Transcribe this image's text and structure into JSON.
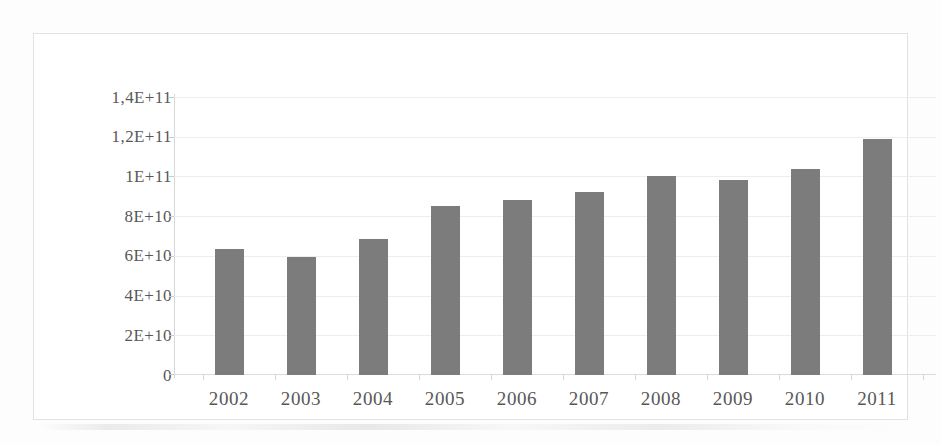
{
  "chart_data": {
    "type": "bar",
    "title": "",
    "subtitle": "",
    "xlabel": "",
    "ylabel": "",
    "categories": [
      "2002",
      "2003",
      "2004",
      "2005",
      "2006",
      "2007",
      "2008",
      "2009",
      "2010",
      "2011"
    ],
    "values": [
      63500000000.0,
      59500000000.0,
      68500000000.0,
      85000000000.0,
      88000000000.0,
      92000000000.0,
      100000000000.0,
      98000000000.0,
      104000000000.0,
      119000000000.0
    ],
    "series": [
      {
        "name": "",
        "values": [
          63500000000.0,
          59500000000.0,
          68500000000.0,
          85000000000.0,
          88000000000.0,
          92000000000.0,
          100000000000.0,
          98000000000.0,
          104000000000.0,
          119000000000.0
        ]
      }
    ],
    "ylim": [
      0,
      140000000000.0
    ],
    "ytick_values": [
      140000000000.0,
      120000000000.0,
      100000000000.0,
      80000000000.0,
      60000000000.0,
      40000000000.0,
      20000000000.0,
      0
    ],
    "ytick_labels": [
      "1,4E+11",
      "1,2E+11",
      "1E+11",
      "8E+10",
      "6E+10",
      "4E+10",
      "2E+10",
      "0"
    ],
    "xtick_labels": [
      "2002",
      "2003",
      "2004",
      "2005",
      "2006",
      "2007",
      "2008",
      "2009",
      "2010",
      "2011"
    ],
    "grid": true,
    "grid_axis": "y",
    "legend": false,
    "legend_position": "none",
    "bar_color": "#797979",
    "grid_color": "#ededed",
    "axis_color": "#d8d8d8",
    "text_color": "#585858",
    "background_color": "#ffffff",
    "decimal_separator": "comma",
    "annotations": []
  }
}
